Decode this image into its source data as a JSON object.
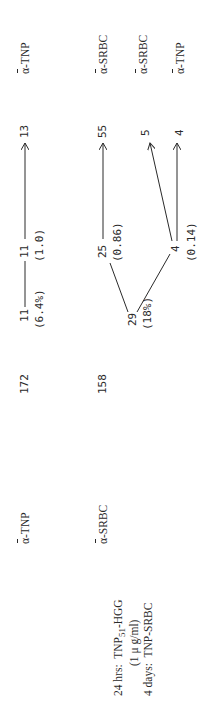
{
  "legend": {
    "line1_prefix": "24 hrs:",
    "line1_agent": "TNP",
    "line1_sub": "51",
    "line1_suffix": "-HGG",
    "line2": "(1 μ g/ml)",
    "line3_prefix": "4 days:",
    "line3_agent": "TNP-SRBC"
  },
  "rows": [
    {
      "specificity": {
        "alpha": "α",
        "label": "-TNP"
      },
      "count": "172",
      "node1": {
        "value": "11",
        "note": "(6.4%)"
      },
      "node2": {
        "value": "11",
        "note": "(1.0)"
      },
      "outputs": [
        {
          "value": "13",
          "specificity_alpha": "α",
          "specificity": "-TNP"
        }
      ]
    },
    {
      "specificity": {
        "alpha": "α",
        "label": "-SRBC"
      },
      "count": "158",
      "node1": {
        "value": "29",
        "note": "(18%)"
      },
      "branches": [
        {
          "value": "25",
          "note": "(0.86)",
          "outputs": [
            {
              "value": "55",
              "specificity_alpha": "α",
              "specificity": "-SRBC"
            }
          ]
        },
        {
          "value": "4",
          "note": "(0.14)",
          "outputs": [
            {
              "value": "5",
              "specificity_alpha": "α",
              "specificity": "-SRBC"
            },
            {
              "value": "4",
              "specificity_alpha": "α",
              "specificity": "-TNP"
            }
          ]
        }
      ]
    }
  ]
}
